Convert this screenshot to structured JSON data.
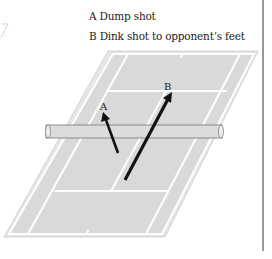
{
  "legend": {
    "items": [
      {
        "key": "A",
        "label": "A Dump shot"
      },
      {
        "key": "B",
        "label": "B Dink shot to opponent’s feet"
      }
    ]
  },
  "diagram": {
    "arrow_labels": {
      "a": "A",
      "b": "B"
    },
    "colors": {
      "court": "#d9d9d9",
      "lines": "#ffffff",
      "net": "#dcdcdc",
      "arrow": "#111111",
      "divider": "#333333"
    }
  }
}
